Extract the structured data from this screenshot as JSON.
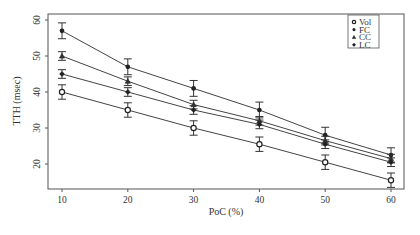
{
  "chart_data": {
    "type": "line",
    "title": "",
    "xlabel": "PoC (%)",
    "ylabel": "TTH (msec)",
    "x": [
      10,
      20,
      30,
      40,
      50,
      60
    ],
    "xticks": [
      "10",
      "20",
      "30",
      "40",
      "50",
      "60"
    ],
    "yticks": [
      "20",
      "30",
      "40",
      "50",
      "60"
    ],
    "xlim": [
      7,
      62
    ],
    "ylim": [
      13,
      61
    ],
    "grid": false,
    "legend_position": "top-right inside",
    "legend": [
      {
        "name": "Vol",
        "marker": "open-circle"
      },
      {
        "name": "FC",
        "marker": "filled-circle"
      },
      {
        "name": "CC",
        "marker": "triangle"
      },
      {
        "name": "LC",
        "marker": "filled-star"
      }
    ],
    "series": [
      {
        "name": "FC",
        "marker": "filled-circle",
        "values": [
          57,
          47,
          41,
          35,
          28,
          22.5
        ],
        "err": [
          2.2,
          2.2,
          2.2,
          2.2,
          2.2,
          2
        ]
      },
      {
        "name": "CC",
        "marker": "triangle",
        "values": [
          50,
          43,
          36.5,
          32,
          26.5,
          21.5
        ],
        "err": [
          1.2,
          1.2,
          1.2,
          1.2,
          1.2,
          1.2
        ]
      },
      {
        "name": "LC",
        "marker": "filled-star",
        "values": [
          45,
          40,
          35,
          31,
          25.5,
          20.5
        ],
        "err": [
          1.2,
          1.2,
          1.2,
          1.2,
          1.2,
          1.2
        ]
      },
      {
        "name": "Vol",
        "marker": "open-circle",
        "values": [
          40,
          35,
          30,
          25.5,
          20.5,
          15.5
        ],
        "err": [
          2,
          2,
          2,
          2,
          2,
          2
        ]
      }
    ]
  }
}
